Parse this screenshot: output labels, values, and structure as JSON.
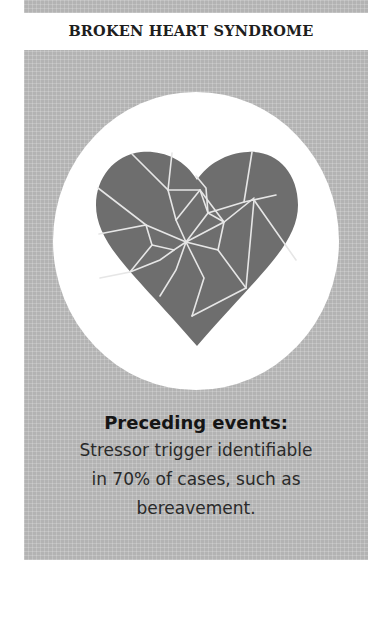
{
  "header": {
    "title": "BROKEN HEART SYNDROME"
  },
  "illustration": {
    "icon": "broken-heart-icon",
    "heart_color": "#6e6e6e",
    "crack_color": "#e6e6e6",
    "circle_color": "#ffffff",
    "panel_color": "#b3b3b3"
  },
  "caption": {
    "heading": "Preceding events:",
    "body": "Stressor trigger identifiable in 70% of cases,  such as bereavement."
  }
}
